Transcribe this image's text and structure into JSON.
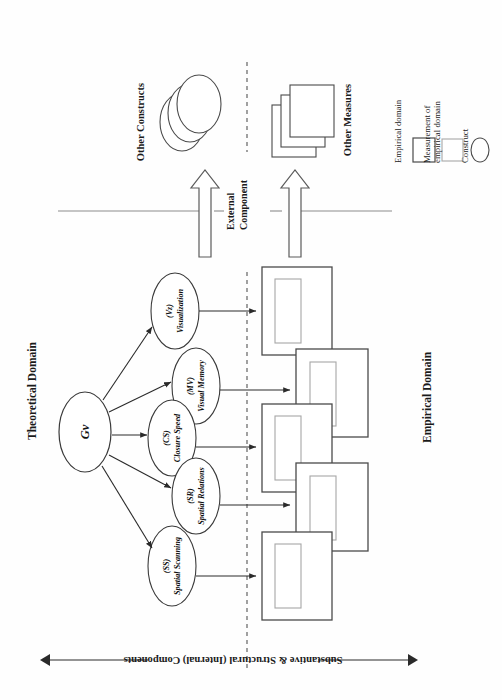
{
  "figure": {
    "orientation": "rotated-90-ccw",
    "domain_labels": {
      "theoretical": "Theoretical Domain",
      "empirical": "Empirical Domain"
    },
    "component_labels": {
      "internal_line1": "Substantive & Structural (Internal) Components",
      "external_line1": "External",
      "external_line2": "Component"
    },
    "other_groups": {
      "constructs": "Other Constructs",
      "measures": "Other Measures"
    }
  },
  "constructs": {
    "root": {
      "name": "Gv",
      "sub": ""
    },
    "children": [
      {
        "name": "Visualization",
        "sub": "(Vz)"
      },
      {
        "name": "Visual Memory",
        "sub": "(MV)"
      },
      {
        "name": "Closure Speed",
        "sub": "(CS)"
      },
      {
        "name": "Spatial Relations",
        "sub": "(SR)"
      },
      {
        "name": "Spatial Scanning",
        "sub": "(SS)"
      }
    ]
  },
  "measures": [
    {
      "for": "Visualization"
    },
    {
      "for": "Visual Memory"
    },
    {
      "for": "Closure Speed"
    },
    {
      "for": "Spatial Relations"
    },
    {
      "for": "Spatial Scanning"
    }
  ],
  "legend": {
    "items": [
      {
        "shape": "square-dark",
        "label": "Empirical domain"
      },
      {
        "shape": "square-light",
        "label": "Measurement of\nempirical domain"
      },
      {
        "shape": "ellipse",
        "label": "Construct"
      }
    ],
    "item0": "Empirical domain",
    "item1a": "Measurement of",
    "item1b": "empirical domain",
    "item2": "Construct"
  },
  "colors": {
    "stroke_dark": "#3a3a3a",
    "stroke_light": "#9a9a9a",
    "text": "#1a1a1a",
    "background": "#ffffff"
  }
}
